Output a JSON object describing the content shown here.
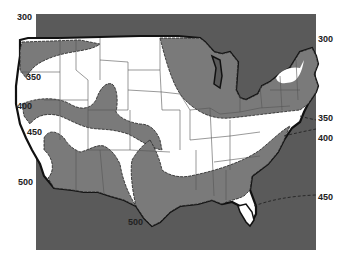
{
  "map": {
    "subject": "Contiguous United States isoline map",
    "colors": {
      "background_box": "#5a5a5a",
      "band_dark": "#7a7a7a",
      "band_light": "#ffffff",
      "outline": "#111111",
      "state_lines": "#555555"
    },
    "contour_labels": [
      {
        "value": "300",
        "x": 17,
        "y": 16
      },
      {
        "value": "300",
        "x": 318,
        "y": 36
      },
      {
        "value": "350",
        "x": 25,
        "y": 73
      },
      {
        "value": "350",
        "x": 318,
        "y": 114
      },
      {
        "value": "400",
        "x": 17,
        "y": 104
      },
      {
        "value": "400",
        "x": 318,
        "y": 134
      },
      {
        "value": "450",
        "x": 28,
        "y": 128
      },
      {
        "value": "450",
        "x": 318,
        "y": 192
      },
      {
        "value": "500",
        "x": 18,
        "y": 177
      },
      {
        "value": "500",
        "x": 128,
        "y": 219
      }
    ]
  }
}
